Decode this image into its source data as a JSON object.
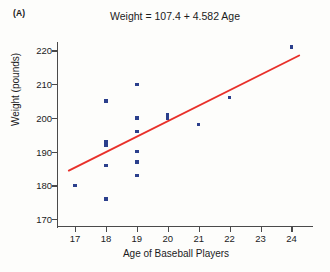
{
  "panel": {
    "label": "(A)"
  },
  "chart_data": {
    "type": "scatter",
    "title": "Weight = 107.4 + 4.582 Age",
    "xlabel": "Age of Baseball Players",
    "ylabel": "Weight (pounds)",
    "xlim": [
      16.45,
      24.6
    ],
    "ylim": [
      168.0,
      222.5
    ],
    "xticks": [
      17,
      18,
      19,
      20,
      21,
      22,
      23,
      24
    ],
    "yticks": [
      170,
      180,
      190,
      200,
      210,
      220
    ],
    "xtick_labels": [
      "17",
      "18",
      "19",
      "20",
      "21",
      "22",
      "23",
      "24"
    ],
    "ytick_labels": [
      "170",
      "180",
      "190",
      "200",
      "210",
      "220"
    ],
    "grid": false,
    "legend": false,
    "marker_color": "#2b3f8c",
    "marker_shape": "square",
    "line_color": "#e8302a",
    "axis_color": "#4a4a4a",
    "background_color": "#fdfdfb",
    "points": [
      {
        "x": 17,
        "y": 180
      },
      {
        "x": 18,
        "y": 205
      },
      {
        "x": 18,
        "y": 193
      },
      {
        "x": 18,
        "y": 192
      },
      {
        "x": 18,
        "y": 186
      },
      {
        "x": 18,
        "y": 176
      },
      {
        "x": 19,
        "y": 210
      },
      {
        "x": 19,
        "y": 200
      },
      {
        "x": 19,
        "y": 196
      },
      {
        "x": 19,
        "y": 190
      },
      {
        "x": 19,
        "y": 187
      },
      {
        "x": 19,
        "y": 183
      },
      {
        "x": 20,
        "y": 201
      },
      {
        "x": 20,
        "y": 200
      },
      {
        "x": 21,
        "y": 198
      },
      {
        "x": 22,
        "y": 206
      },
      {
        "x": 24,
        "y": 221
      }
    ],
    "regression": {
      "equation": "Weight = 107.4 + 4.582 Age",
      "intercept": 107.4,
      "slope": 4.582,
      "x_start": 16.8,
      "y_start": 184.4,
      "x_end": 24.25,
      "y_end": 218.5
    }
  }
}
